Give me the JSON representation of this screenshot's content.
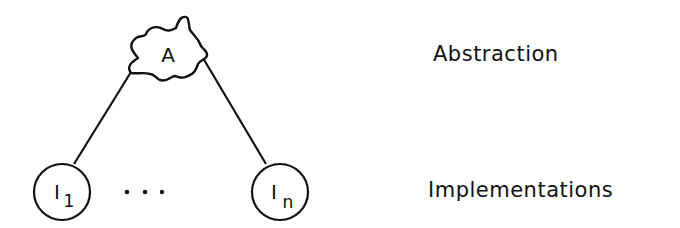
{
  "diagram": {
    "abstraction_node": {
      "label": "A"
    },
    "implementation_nodes": [
      {
        "label": "I",
        "subscript": "1"
      },
      {
        "label": "I",
        "subscript": "n"
      }
    ],
    "ellipsis": "...",
    "levels": {
      "top": "Abstraction",
      "bottom": "Implementations"
    },
    "colors": {
      "stroke": "#111111",
      "background": "#ffffff"
    }
  }
}
